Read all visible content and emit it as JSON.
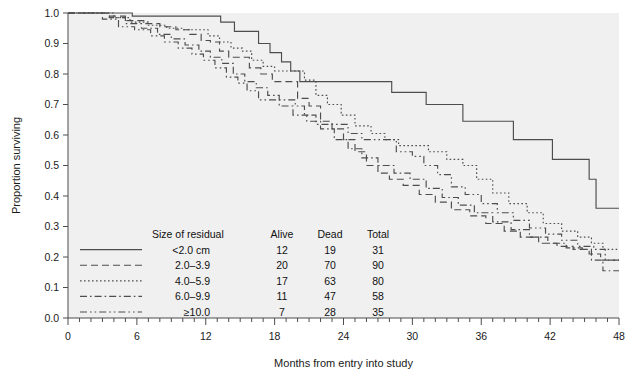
{
  "chart_data": {
    "type": "line",
    "title": "",
    "subtitle": "",
    "xlabel": "Months from entry into study",
    "ylabel": "Proportion surviving",
    "xlim": [
      0,
      48
    ],
    "ylim": [
      0.0,
      1.0
    ],
    "xticks": [
      0,
      6,
      12,
      18,
      24,
      30,
      36,
      42,
      48
    ],
    "xtick_labels": [
      "0",
      "6",
      "12",
      "18",
      "24",
      "30",
      "36",
      "42",
      "48"
    ],
    "x_minor_tick_step": 1,
    "yticks": [
      0.0,
      0.1,
      0.2,
      0.3,
      0.4,
      0.5,
      0.6,
      0.7,
      0.8,
      0.9,
      1.0
    ],
    "ytick_labels": [
      "0.0",
      "0.1",
      "0.2",
      "0.3",
      "0.4",
      "0.5",
      "0.6",
      "0.7",
      "0.8",
      "0.9",
      "1.0"
    ],
    "grid": false,
    "legend_position": "lower-left-inside",
    "plot_bg_color": "#f0f0f0",
    "line_color": "#4d4d4d",
    "series": [
      {
        "name": "<2.0 cm",
        "dash": "solid",
        "alive": 12,
        "dead": 19,
        "total": 31,
        "points": [
          [
            0,
            1.0
          ],
          [
            1.0,
            1.0
          ],
          [
            4.2,
            1.0
          ],
          [
            5.6,
            0.99
          ],
          [
            9.4,
            0.99
          ],
          [
            13.3,
            0.97
          ],
          [
            14.5,
            0.94
          ],
          [
            15.5,
            0.94
          ],
          [
            16.6,
            0.9
          ],
          [
            17.6,
            0.87
          ],
          [
            18.6,
            0.84
          ],
          [
            19.4,
            0.81
          ],
          [
            20.2,
            0.775
          ],
          [
            27.0,
            0.775
          ],
          [
            28.2,
            0.74
          ],
          [
            29.8,
            0.74
          ],
          [
            31.2,
            0.7
          ],
          [
            33.0,
            0.7
          ],
          [
            34.4,
            0.645
          ],
          [
            37.5,
            0.645
          ],
          [
            38.8,
            0.585
          ],
          [
            41.0,
            0.585
          ],
          [
            42.2,
            0.52
          ],
          [
            44.0,
            0.52
          ],
          [
            45.4,
            0.455
          ],
          [
            46.0,
            0.36
          ],
          [
            48,
            0.36
          ]
        ]
      },
      {
        "name": "2.0–3.9",
        "dash": "dashed",
        "alive": 20,
        "dead": 70,
        "total": 90,
        "points": [
          [
            0,
            1.0
          ],
          [
            2.0,
            1.0
          ],
          [
            3.4,
            0.99
          ],
          [
            5.0,
            0.975
          ],
          [
            6.6,
            0.965
          ],
          [
            8.0,
            0.955
          ],
          [
            9.4,
            0.945
          ],
          [
            10.6,
            0.93
          ],
          [
            11.6,
            0.91
          ],
          [
            12.4,
            0.905
          ],
          [
            13.2,
            0.875
          ],
          [
            14.0,
            0.855
          ],
          [
            15.0,
            0.855
          ],
          [
            15.8,
            0.82
          ],
          [
            16.8,
            0.8
          ],
          [
            17.8,
            0.775
          ],
          [
            19.0,
            0.775
          ],
          [
            20.0,
            0.72
          ],
          [
            21.0,
            0.695
          ],
          [
            22.0,
            0.645
          ],
          [
            23.0,
            0.62
          ],
          [
            24.0,
            0.585
          ],
          [
            25.0,
            0.545
          ],
          [
            26.0,
            0.5
          ],
          [
            27.0,
            0.475
          ],
          [
            28.0,
            0.455
          ],
          [
            29.2,
            0.435
          ],
          [
            30.6,
            0.405
          ],
          [
            32.0,
            0.38
          ],
          [
            33.4,
            0.355
          ],
          [
            35.0,
            0.335
          ],
          [
            36.4,
            0.31
          ],
          [
            38.0,
            0.285
          ],
          [
            39.4,
            0.265
          ],
          [
            41.0,
            0.245
          ],
          [
            42.6,
            0.235
          ],
          [
            44.0,
            0.225
          ],
          [
            45.4,
            0.21
          ],
          [
            46.4,
            0.19
          ],
          [
            48,
            0.19
          ]
        ]
      },
      {
        "name": "4.0–5.9",
        "dash": "dotted",
        "alive": 17,
        "dead": 63,
        "total": 80,
        "points": [
          [
            0,
            1.0
          ],
          [
            2.4,
            1.0
          ],
          [
            4.0,
            0.985
          ],
          [
            5.4,
            0.97
          ],
          [
            7.0,
            0.96
          ],
          [
            8.6,
            0.95
          ],
          [
            10.0,
            0.945
          ],
          [
            11.4,
            0.945
          ],
          [
            12.2,
            0.925
          ],
          [
            13.2,
            0.905
          ],
          [
            14.2,
            0.885
          ],
          [
            15.2,
            0.875
          ],
          [
            16.0,
            0.845
          ],
          [
            17.0,
            0.825
          ],
          [
            18.0,
            0.81
          ],
          [
            19.2,
            0.81
          ],
          [
            20.6,
            0.78
          ],
          [
            21.6,
            0.73
          ],
          [
            22.6,
            0.7
          ],
          [
            23.8,
            0.665
          ],
          [
            25.0,
            0.63
          ],
          [
            26.4,
            0.605
          ],
          [
            27.6,
            0.585
          ],
          [
            28.8,
            0.565
          ],
          [
            30.0,
            0.565
          ],
          [
            31.4,
            0.545
          ],
          [
            33.0,
            0.52
          ],
          [
            34.4,
            0.5
          ],
          [
            35.6,
            0.455
          ],
          [
            37.0,
            0.41
          ],
          [
            38.4,
            0.375
          ],
          [
            40.0,
            0.345
          ],
          [
            41.4,
            0.31
          ],
          [
            43.0,
            0.285
          ],
          [
            44.4,
            0.265
          ],
          [
            45.6,
            0.245
          ],
          [
            46.6,
            0.225
          ],
          [
            48,
            0.225
          ]
        ]
      },
      {
        "name": "6.0–9.9",
        "dash": "dashdot",
        "alive": 11,
        "dead": 47,
        "total": 58,
        "points": [
          [
            0,
            1.0
          ],
          [
            2.2,
            1.0
          ],
          [
            3.6,
            0.985
          ],
          [
            5.0,
            0.965
          ],
          [
            6.4,
            0.95
          ],
          [
            7.8,
            0.93
          ],
          [
            9.0,
            0.915
          ],
          [
            10.2,
            0.895
          ],
          [
            11.4,
            0.875
          ],
          [
            12.4,
            0.855
          ],
          [
            13.4,
            0.835
          ],
          [
            14.4,
            0.8
          ],
          [
            15.4,
            0.775
          ],
          [
            16.4,
            0.755
          ],
          [
            17.4,
            0.73
          ],
          [
            18.4,
            0.695
          ],
          [
            19.6,
            0.665
          ],
          [
            20.8,
            0.645
          ],
          [
            22.0,
            0.62
          ],
          [
            23.2,
            0.585
          ],
          [
            24.4,
            0.555
          ],
          [
            25.6,
            0.525
          ],
          [
            27.0,
            0.5
          ],
          [
            28.4,
            0.475
          ],
          [
            29.8,
            0.455
          ],
          [
            31.2,
            0.425
          ],
          [
            32.6,
            0.395
          ],
          [
            34.0,
            0.37
          ],
          [
            35.4,
            0.345
          ],
          [
            37.0,
            0.315
          ],
          [
            38.6,
            0.29
          ],
          [
            40.2,
            0.265
          ],
          [
            41.8,
            0.245
          ],
          [
            43.4,
            0.23
          ],
          [
            44.8,
            0.225
          ],
          [
            45.6,
            0.19
          ],
          [
            46.6,
            0.155
          ],
          [
            48,
            0.155
          ]
        ]
      },
      {
        "name": "≥10.0",
        "dash": "dashdotdot",
        "alive": 7,
        "dead": 28,
        "total": 35,
        "points": [
          [
            0,
            1.0
          ],
          [
            1.8,
            1.0
          ],
          [
            3.0,
            0.98
          ],
          [
            4.4,
            0.955
          ],
          [
            5.8,
            0.945
          ],
          [
            7.2,
            0.925
          ],
          [
            8.4,
            0.905
          ],
          [
            9.6,
            0.885
          ],
          [
            10.8,
            0.865
          ],
          [
            11.8,
            0.845
          ],
          [
            12.8,
            0.82
          ],
          [
            13.8,
            0.79
          ],
          [
            14.8,
            0.77
          ],
          [
            15.6,
            0.745
          ],
          [
            16.6,
            0.715
          ],
          [
            18.8,
            0.715
          ],
          [
            19.8,
            0.695
          ],
          [
            20.6,
            0.665
          ],
          [
            21.6,
            0.635
          ],
          [
            23.4,
            0.635
          ],
          [
            24.4,
            0.605
          ],
          [
            25.6,
            0.585
          ],
          [
            27.4,
            0.585
          ],
          [
            28.6,
            0.545
          ],
          [
            30.0,
            0.53
          ],
          [
            31.0,
            0.5
          ],
          [
            32.2,
            0.47
          ],
          [
            33.4,
            0.43
          ],
          [
            34.6,
            0.405
          ],
          [
            36.0,
            0.375
          ],
          [
            37.4,
            0.345
          ],
          [
            38.8,
            0.32
          ],
          [
            40.2,
            0.295
          ],
          [
            41.6,
            0.275
          ],
          [
            43.0,
            0.255
          ],
          [
            44.4,
            0.235
          ],
          [
            45.8,
            0.225
          ],
          [
            46.8,
            0.19
          ],
          [
            48,
            0.19
          ]
        ]
      }
    ]
  },
  "legend": {
    "headers": [
      "Size of residual",
      "Alive",
      "Dead",
      "Total"
    ],
    "rows": [
      {
        "label": "<2.0 cm",
        "alive": "12",
        "dead": "19",
        "total": "31"
      },
      {
        "label": "2.0–3.9",
        "alive": "20",
        "dead": "70",
        "total": "90"
      },
      {
        "label": "4.0–5.9",
        "alive": "17",
        "dead": "63",
        "total": "80"
      },
      {
        "label": "6.0–9.9",
        "alive": "11",
        "dead": "47",
        "total": "58"
      },
      {
        "label": "≥10.0",
        "alive": "7",
        "dead": "28",
        "total": "35"
      }
    ]
  }
}
